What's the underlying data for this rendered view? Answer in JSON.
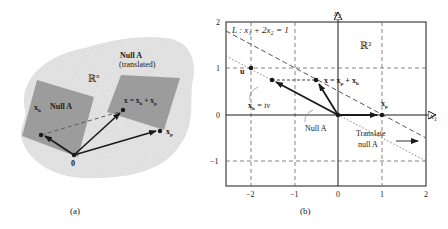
{
  "panel_a": {
    "caption": "(a)",
    "space_label": "ℝ",
    "space_sup": "n",
    "null_label": "Null A",
    "translated_label_1": "Null A",
    "translated_label_2": "(translated)",
    "xh_label": "x",
    "xh_sub": "h",
    "x_label": "x = x",
    "x_label_sub1": "h",
    "x_label_plus": " + x",
    "x_label_sub2": "p",
    "xp_label": "x",
    "xp_sub": "p",
    "origin_label": "0"
  },
  "panel_b": {
    "caption": "(b)",
    "line_label": "L : x₁ + 2x₂ = 1",
    "space_label": "ℝ²",
    "x_axis_label": "x",
    "x_axis_sub": "1",
    "y_axis_label": "x",
    "y_axis_sub": "2",
    "u_label": "u",
    "xh_label": "x",
    "xh_sub": "h",
    "xh_eq": " = tv",
    "x_label": "x = x",
    "x_label_sub1": "p",
    "x_label_plus": " + x",
    "x_label_sub2": "h",
    "xp_label": "x",
    "xp_sub": "p",
    "null_label": "Null A",
    "translate_1": "Translate",
    "translate_2": "null A",
    "x_ticks": [
      "−2",
      "−1",
      "0",
      "1",
      "2"
    ],
    "y_ticks": [
      "2",
      "1",
      "0",
      "−1"
    ]
  },
  "colors": {
    "blob": "#e4e4e4",
    "plane": "#9a9a9a",
    "ink": "#1a1a1a",
    "grid": "#555555"
  }
}
